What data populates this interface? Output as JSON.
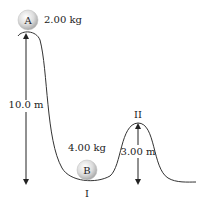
{
  "ball_a": {
    "letter": "A",
    "mass_label": "2.00 kg"
  },
  "ball_b": {
    "letter": "B",
    "mass_label": "4.00 kg"
  },
  "points": {
    "valley": "I",
    "hill": "II"
  },
  "dimensions": {
    "start_height": "10.0 m",
    "hill_height": "3.00 m"
  },
  "colors": {
    "track": "#333333",
    "ball_light": "#ffffff",
    "ball_dark": "#b8b8b8"
  }
}
